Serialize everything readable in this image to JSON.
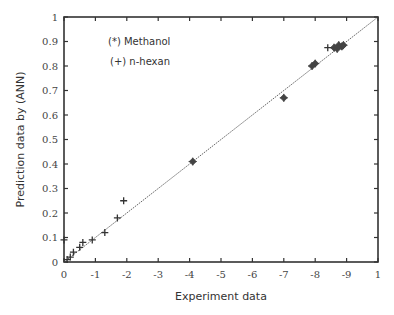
{
  "chart_data": {
    "type": "scatter",
    "title": "",
    "xlabel": "Experiment data",
    "ylabel": "Prediction data by (ANN)",
    "xlim": [
      0,
      1
    ],
    "ylim": [
      0,
      1
    ],
    "x_tick_labels": [
      "0",
      "-1",
      "-2",
      "-3",
      "-4",
      "-5",
      "-6",
      "-7",
      "-8",
      "-9",
      "1"
    ],
    "y_tick_labels": [
      "0",
      "0.1",
      "0.2",
      "0.3",
      "0.4",
      "0.5",
      "0.6",
      "0.7",
      "0.8",
      "0.9",
      "1"
    ],
    "grid": false,
    "reference_line": {
      "from": [
        0,
        0
      ],
      "to": [
        1,
        1
      ],
      "style": "dotted"
    },
    "annotations": [
      "(*) Methanol",
      "(+) n-hexan"
    ],
    "series": [
      {
        "name": "Methanol",
        "marker": "*",
        "points": [
          [
            0.41,
            0.41
          ],
          [
            0.7,
            0.67
          ],
          [
            0.79,
            0.8
          ],
          [
            0.8,
            0.81
          ],
          [
            0.86,
            0.875
          ],
          [
            0.87,
            0.87
          ],
          [
            0.875,
            0.885
          ],
          [
            0.885,
            0.88
          ],
          [
            0.89,
            0.885
          ]
        ]
      },
      {
        "name": "n-hexan",
        "marker": "+",
        "points": [
          [
            0.0,
            0.09
          ],
          [
            0.01,
            0.01
          ],
          [
            0.02,
            0.02
          ],
          [
            0.03,
            0.04
          ],
          [
            0.05,
            0.06
          ],
          [
            0.06,
            0.08
          ],
          [
            0.09,
            0.09
          ],
          [
            0.13,
            0.12
          ],
          [
            0.17,
            0.18
          ],
          [
            0.19,
            0.25
          ],
          [
            0.84,
            0.875
          ]
        ]
      }
    ]
  }
}
